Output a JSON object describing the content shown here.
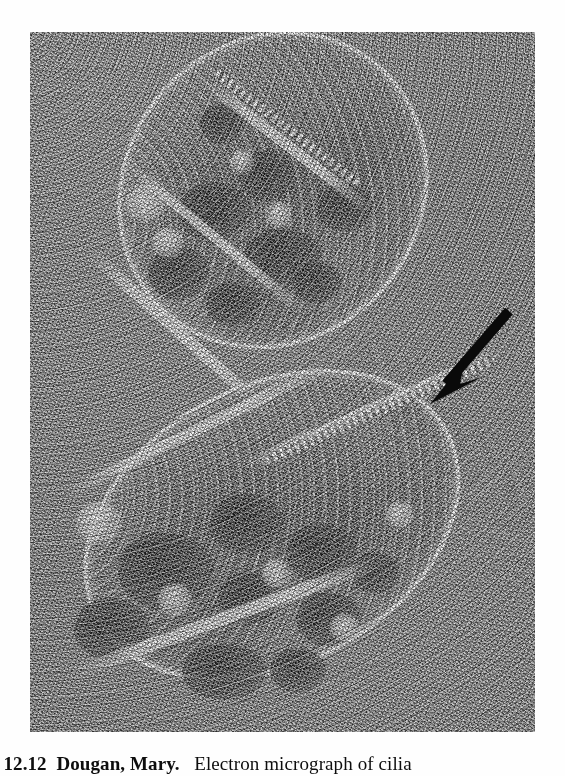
{
  "page": {
    "background_color": "#fefefe",
    "width": 565,
    "height": 776
  },
  "figure": {
    "name": "electron-micrograph-of-cilia",
    "alt_description": "Grayscale freeze-fracture transmission electron micrograph showing two obliquely sectioned cilia as elongated oval profiles with bright fractured membranes, dark internal dense bodies and rows of membrane particles, set in a heavily grained background field.",
    "plate": {
      "left": 30,
      "top": 32,
      "width": 505,
      "height": 700,
      "base_tone": "#8b8b8b",
      "modality": "freeze-fracture transmission electron micrograph",
      "specimen": "cilia"
    },
    "annotation": {
      "type": "arrow",
      "color": "#0a0a0a",
      "points_to": "row of membrane particles on the ciliary necklace",
      "tail_x": 507,
      "tail_y": 312,
      "tip_x": 430,
      "tip_y": 402
    },
    "structures": [
      {
        "label": "upper cilium",
        "orientation": "oblique, upper-left to lower-right"
      },
      {
        "label": "lower cilium",
        "orientation": "oblique, lower-left to upper-right"
      }
    ]
  },
  "caption": {
    "clipped": true,
    "figure_label": "RE 12.12",
    "credit": "Dougan, Mary.",
    "text": "Electron micrograph of cilia",
    "full_line": "RE 12.12  Dougan, Mary.   Electron micrograph of cilia"
  }
}
